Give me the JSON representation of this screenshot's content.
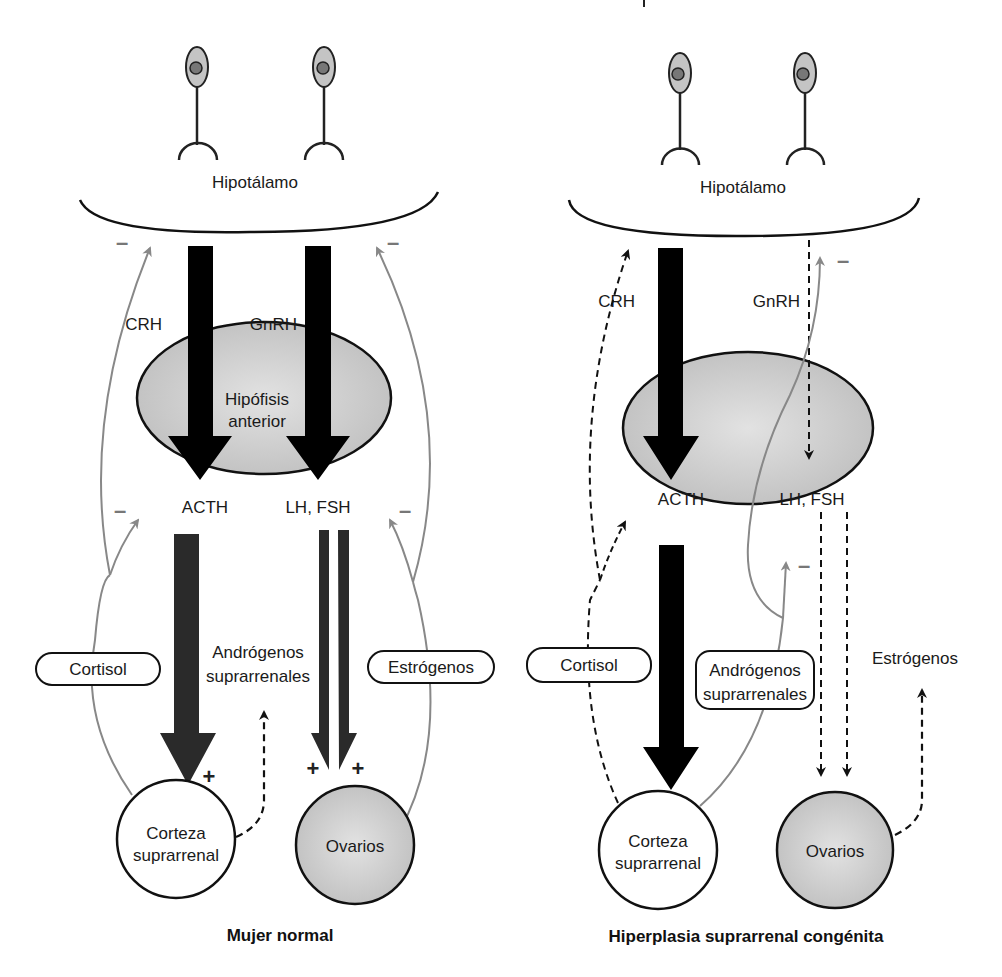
{
  "panels": [
    {
      "id": "normal",
      "title": "Mujer normal",
      "hypothalamus": "Hipotálamo",
      "pituitary": [
        "Hipófisis",
        "anterior"
      ],
      "hormones": {
        "crh": "CRH",
        "gnrh": "GnRH",
        "acth": "ACTH",
        "lhfsh": "LH, FSH",
        "cortisol": "Cortisol",
        "androgens": [
          "Andrógenos",
          "suprarrenales"
        ],
        "estrogens": "Estrógenos"
      },
      "organs": {
        "adrenal": [
          "Corteza",
          "suprarrenal"
        ],
        "ovaries": "Ovarios"
      },
      "signs": {
        "negative": "–",
        "positive": "+"
      }
    },
    {
      "id": "chc",
      "title": "Hiperplasia suprarrenal congénita",
      "hypothalamus": "Hipotálamo",
      "hormones": {
        "crh": "CRH",
        "gnrh": "GnRH",
        "acth": "ACTH",
        "lhfsh": "LH, FSH",
        "cortisol": "Cortisol",
        "androgens": [
          "Andrógenos",
          "suprarrenales"
        ],
        "estrogens": "Estrógenos"
      },
      "organs": {
        "adrenal": [
          "Corteza",
          "suprarrenal"
        ],
        "ovaries": "Ovarios"
      },
      "signs": {
        "negative": "–"
      }
    }
  ],
  "colors": {
    "ink": "#111111",
    "feedback": "#888888",
    "organ_fill": "#c8c8c8",
    "arrow_dark": "#2a2a2a"
  }
}
